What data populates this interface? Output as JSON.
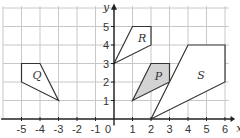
{
  "axes": {
    "x_label": "x",
    "y_label": "y",
    "origin_label": "0",
    "x_ticks": [
      "-5",
      "-4",
      "-3",
      "-2",
      "-1",
      "1",
      "2",
      "3",
      "4",
      "5",
      "6"
    ],
    "y_ticks": [
      "1",
      "2",
      "3",
      "4",
      "5"
    ]
  },
  "shapes": [
    {
      "name": "Q",
      "points": [
        [
          -5,
          3
        ],
        [
          -4,
          3
        ],
        [
          -3,
          1
        ],
        [
          -5,
          2
        ]
      ],
      "fill": "#ffffff",
      "label_at": [
        -4.4,
        2.4
      ]
    },
    {
      "name": "R",
      "points": [
        [
          0,
          3
        ],
        [
          1,
          5
        ],
        [
          2,
          5
        ],
        [
          2,
          4
        ]
      ],
      "fill": "#ffffff",
      "label_at": [
        1.3,
        4.4
      ]
    },
    {
      "name": "P",
      "points": [
        [
          1,
          1
        ],
        [
          2,
          3
        ],
        [
          3,
          3
        ],
        [
          3,
          2
        ]
      ],
      "fill": "#d3d3d3",
      "label_at": [
        2.2,
        2.3
      ]
    },
    {
      "name": "S",
      "points": [
        [
          2,
          0
        ],
        [
          4,
          4
        ],
        [
          6,
          4
        ],
        [
          6,
          2
        ]
      ],
      "fill": "#ffffff",
      "label_at": [
        4.5,
        2.4
      ]
    }
  ],
  "colors": {
    "grid": "#c8c8c8",
    "axis": "#222222",
    "outline": "#333333",
    "shaded": "#d3d3d3"
  }
}
